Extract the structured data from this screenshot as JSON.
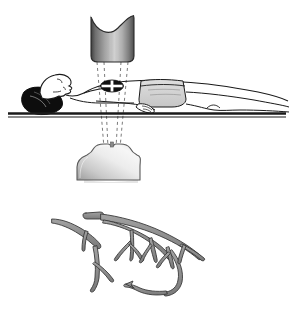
{
  "figure": {
    "title": "Cardiac X-ray imaging setup with coronary artery tree",
    "background_color": "#ffffff",
    "width": 292,
    "height": 309
  },
  "panels": [
    {
      "id": "imaging-setup",
      "label": "Patient supine between X-ray tube and detector"
    },
    {
      "id": "coronary-tree",
      "label": "Coronary artery tree"
    }
  ],
  "xray_source": {
    "name": "x-ray-tube",
    "label": "X-ray tube",
    "shape": "concave-top-cylinder",
    "outline_color": "#2b2b2b",
    "gradient_dark": "#4a4a4a",
    "gradient_mid": "#b4b4b4",
    "gradient_light": "#d8d8d8",
    "x": 90,
    "y": 12,
    "width": 45,
    "height": 50
  },
  "xray_detector": {
    "name": "image-detector",
    "label": "Image detector",
    "shape": "notched-dome-base",
    "outline_color": "#555555",
    "gradient_dark": "#9a9a9a",
    "gradient_light": "#f2f2f2",
    "x": 76,
    "y": 142,
    "width": 64,
    "height": 40
  },
  "beam": {
    "name": "x-ray-beam",
    "label": "X-ray beam path",
    "style": "dashed",
    "color": "#6b6b6b",
    "dash": "3 3",
    "apex_x": 112,
    "source_bottom_y": 62,
    "detector_top_y": 146
  },
  "patient": {
    "name": "patient-body",
    "label": "Supine patient",
    "outline_color": "#1a1a1a",
    "skin_fill": "#ffffff",
    "hair_fill": "#0d0d0d",
    "garment_fill": "#d6d6d6",
    "head_x": 22,
    "feet_x": 288,
    "body_y": 72
  },
  "table": {
    "name": "exam-table",
    "label": "Examination table",
    "color": "#1a1a1a",
    "x1": 8,
    "x2": 286,
    "y": 113,
    "thickness": 4
  },
  "heart_marker": {
    "name": "heart-target-marker",
    "label": "Heart region of interest",
    "shape": "ellipse-with-cross",
    "fill": "#111111",
    "cross_color": "#ffffff",
    "cx": 112,
    "cy": 86,
    "rx": 11,
    "ry": 5.5
  },
  "coronary_tree": {
    "name": "coronary-artery-tree",
    "label": "Coronary artery tree",
    "vessel_fill": "#8e8e8e",
    "vessel_outline": "#3a3a3a",
    "bounds": {
      "x": 48,
      "y": 205,
      "width": 160,
      "height": 95
    },
    "branch_count": 14
  },
  "shadow": {
    "name": "detector-shadow",
    "color": "#cfcfcf",
    "opacity": 0.55
  }
}
